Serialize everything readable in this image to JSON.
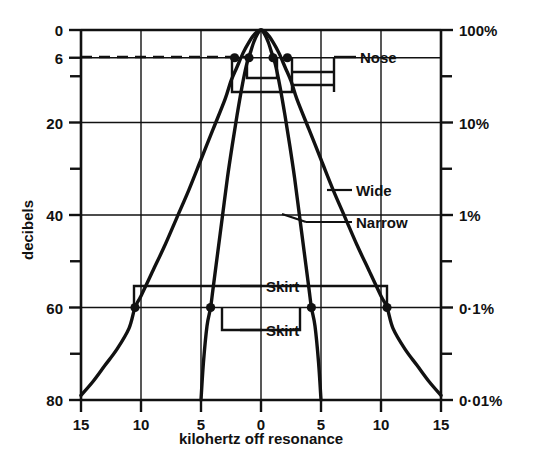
{
  "chart_data": {
    "type": "line",
    "title": "",
    "subtitle": "",
    "xlabel": "kilohertz off resonance",
    "ylabel": "decibels",
    "y2label": "",
    "grid": true,
    "legend_position": "inline-annotations",
    "xlim": [
      -15,
      15
    ],
    "ylim_db": [
      0,
      80
    ],
    "x_ticks": [
      {
        "value": -15,
        "label": "15"
      },
      {
        "value": -10,
        "label": "10"
      },
      {
        "value": -5,
        "label": "5"
      },
      {
        "value": 0,
        "label": "0"
      },
      {
        "value": 5,
        "label": "5"
      },
      {
        "value": 10,
        "label": "10"
      },
      {
        "value": 15,
        "label": "15"
      }
    ],
    "y_ticks_left": [
      {
        "value": 0,
        "label": "0",
        "major": true
      },
      {
        "value": 6,
        "label": "6",
        "major": true
      },
      {
        "value": 10,
        "label": "",
        "major": false
      },
      {
        "value": 20,
        "label": "20",
        "major": true
      },
      {
        "value": 30,
        "label": "",
        "major": false
      },
      {
        "value": 40,
        "label": "40",
        "major": true
      },
      {
        "value": 50,
        "label": "",
        "major": false
      },
      {
        "value": 60,
        "label": "60",
        "major": true
      },
      {
        "value": 70,
        "label": "",
        "major": false
      },
      {
        "value": 80,
        "label": "80",
        "major": true
      }
    ],
    "y_ticks_right": [
      {
        "value": 0,
        "label": "100%",
        "major": true
      },
      {
        "value": 10,
        "label": "",
        "major": false
      },
      {
        "value": 20,
        "label": "10%",
        "major": true
      },
      {
        "value": 30,
        "label": "",
        "major": false
      },
      {
        "value": 40,
        "label": "1%",
        "major": true
      },
      {
        "value": 50,
        "label": "",
        "major": false
      },
      {
        "value": 60,
        "label": "0·1%",
        "major": true
      },
      {
        "value": 70,
        "label": "",
        "major": false
      },
      {
        "value": 80,
        "label": "0·01%",
        "major": true
      }
    ],
    "series": [
      {
        "name": "Wide",
        "points_khz_db": [
          [
            -15.0,
            79.0
          ],
          [
            -14.0,
            76.0
          ],
          [
            -13.0,
            72.5
          ],
          [
            -12.0,
            69.0
          ],
          [
            -11.0,
            64.5
          ],
          [
            -10.5,
            60.0
          ],
          [
            -10.0,
            57.5
          ],
          [
            -9.0,
            52.0
          ],
          [
            -8.0,
            46.5
          ],
          [
            -7.0,
            40.5
          ],
          [
            -6.0,
            34.5
          ],
          [
            -5.0,
            28.0
          ],
          [
            -4.0,
            21.5
          ],
          [
            -3.0,
            15.0
          ],
          [
            -2.5,
            11.0
          ],
          [
            -2.0,
            8.0
          ],
          [
            -1.5,
            5.0
          ],
          [
            -1.0,
            2.6
          ],
          [
            -0.5,
            0.8
          ],
          [
            0.0,
            0.0
          ],
          [
            0.5,
            0.8
          ],
          [
            1.0,
            2.6
          ],
          [
            1.5,
            5.0
          ],
          [
            2.0,
            8.0
          ],
          [
            2.5,
            11.0
          ],
          [
            3.0,
            15.0
          ],
          [
            4.0,
            21.5
          ],
          [
            5.0,
            28.0
          ],
          [
            6.0,
            34.5
          ],
          [
            7.0,
            40.5
          ],
          [
            8.0,
            46.5
          ],
          [
            9.0,
            52.0
          ],
          [
            10.0,
            57.5
          ],
          [
            10.5,
            60.0
          ],
          [
            11.0,
            64.5
          ],
          [
            12.0,
            69.0
          ],
          [
            13.0,
            72.5
          ],
          [
            14.0,
            76.0
          ],
          [
            15.0,
            79.0
          ]
        ],
        "nose_6db_points_khz": [
          -2.2,
          2.2
        ],
        "skirt_60db_points_khz": [
          -10.5,
          10.5
        ]
      },
      {
        "name": "Narrow",
        "points_khz_db": [
          [
            -5.0,
            80.0
          ],
          [
            -4.8,
            72.0
          ],
          [
            -4.5,
            64.0
          ],
          [
            -4.2,
            60.0
          ],
          [
            -4.0,
            56.0
          ],
          [
            -3.6,
            48.0
          ],
          [
            -3.2,
            40.0
          ],
          [
            -2.8,
            32.0
          ],
          [
            -2.4,
            25.0
          ],
          [
            -2.0,
            18.5
          ],
          [
            -1.6,
            12.5
          ],
          [
            -1.2,
            7.5
          ],
          [
            -0.9,
            5.0
          ],
          [
            -0.6,
            2.6
          ],
          [
            -0.3,
            0.9
          ],
          [
            0.0,
            0.0
          ],
          [
            0.3,
            0.9
          ],
          [
            0.6,
            2.6
          ],
          [
            0.9,
            5.0
          ],
          [
            1.2,
            7.5
          ],
          [
            1.6,
            12.5
          ],
          [
            2.0,
            18.5
          ],
          [
            2.4,
            25.0
          ],
          [
            2.8,
            32.0
          ],
          [
            3.2,
            40.0
          ],
          [
            3.6,
            48.0
          ],
          [
            4.0,
            56.0
          ],
          [
            4.2,
            60.0
          ],
          [
            4.5,
            64.0
          ],
          [
            4.8,
            72.0
          ],
          [
            5.0,
            80.0
          ]
        ],
        "nose_6db_points_khz": [
          -1.0,
          1.0
        ],
        "skirt_60db_points_khz": [
          -4.2,
          4.2
        ]
      }
    ],
    "annotations": [
      {
        "text": "Nose",
        "target": "6 dB bandwidth bracket"
      },
      {
        "text": "Wide",
        "target": "wide filter response curve"
      },
      {
        "text": "Narrow",
        "target": "narrow filter response curve"
      },
      {
        "text": "Skirt",
        "target": "wide filter 60 dB bracket"
      },
      {
        "text": "Skirt",
        "target": "narrow filter 60 dB bracket"
      }
    ],
    "dashed_reference_line_db": 6,
    "colors": {
      "ink": "#111111",
      "grid": "#111111",
      "background": "#ffffff"
    }
  },
  "axis": {
    "xlabel": "kilohertz off resonance",
    "ylabel": "decibels"
  },
  "annotations": {
    "nose": "Nose",
    "wide": "Wide",
    "narrow": "Narrow",
    "skirt_upper": "Skirt",
    "skirt_lower": "Skirt"
  },
  "x_tick_labels": [
    "15",
    "10",
    "5",
    "0",
    "5",
    "10",
    "15"
  ],
  "y_tick_labels_left": [
    "0",
    "6",
    "20",
    "40",
    "60",
    "80"
  ],
  "y_tick_labels_right": [
    "100%",
    "10%",
    "1%",
    "0·1%",
    "0·01%"
  ]
}
